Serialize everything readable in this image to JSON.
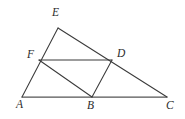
{
  "figure": {
    "stroke_color": "#3a3a3a",
    "base_stroke_color": "#555555",
    "background_color": "#ffffff",
    "label_color": "#2b2b2b"
  },
  "vertices": {
    "A": {
      "label": "A",
      "x": 22,
      "y": 97,
      "label_x": 16,
      "label_y": 99
    },
    "B": {
      "label": "B",
      "x": 92,
      "y": 97,
      "label_x": 87,
      "label_y": 100
    },
    "C": {
      "label": "C",
      "x": 167,
      "y": 97,
      "label_x": 166,
      "label_y": 100
    },
    "D": {
      "label": "D",
      "x": 112,
      "y": 60,
      "label_x": 117,
      "label_y": 48
    },
    "E": {
      "label": "E",
      "x": 58,
      "y": 28,
      "label_x": 52,
      "label_y": 7
    },
    "F": {
      "label": "F",
      "x": 39,
      "y": 60,
      "label_x": 27,
      "label_y": 49
    }
  },
  "segments": [
    {
      "name": "segment-AC",
      "from": "A",
      "to": "C",
      "style": "base"
    },
    {
      "name": "segment-AE",
      "from": "A",
      "to": "E",
      "style": "normal"
    },
    {
      "name": "segment-EC",
      "from": "E",
      "to": "C",
      "style": "normal"
    },
    {
      "name": "segment-FD",
      "from": "F",
      "to": "D",
      "style": "normal"
    },
    {
      "name": "segment-FB",
      "from": "F",
      "to": "B",
      "style": "normal"
    },
    {
      "name": "segment-DB",
      "from": "D",
      "to": "B",
      "style": "normal"
    }
  ],
  "labels_order": [
    "E",
    "F",
    "D",
    "A",
    "B",
    "C"
  ]
}
